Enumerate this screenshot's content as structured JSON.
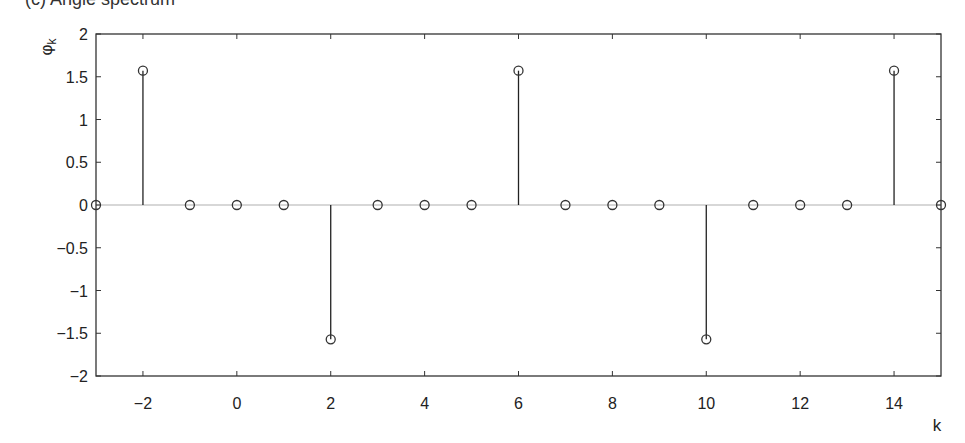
{
  "chart_data": {
    "type": "stem",
    "title": "(c) Angle spectrum",
    "title_note": "title is cropped at top edge; only glyph bottoms are visible",
    "xlabel": "k",
    "ylabel": "φ_k",
    "xlim": [
      -3,
      15
    ],
    "ylim": [
      -2,
      2
    ],
    "xticks": [
      -2,
      0,
      2,
      4,
      6,
      8,
      10,
      12,
      14
    ],
    "xtick_labels": [
      "−2",
      "0",
      "2",
      "4",
      "6",
      "8",
      "10",
      "12",
      "14"
    ],
    "yticks": [
      2,
      1.5,
      1,
      0.5,
      0,
      -0.5,
      -1,
      -1.5,
      -2
    ],
    "ytick_labels": [
      "2",
      "1.5",
      "1",
      "0.5",
      "0",
      "−0.5",
      "−1",
      "−1.5",
      "−2"
    ],
    "grid": false,
    "legend": null,
    "baseline": 0,
    "marker": "open-circle",
    "x": [
      -3,
      -2,
      -1,
      0,
      1,
      2,
      3,
      4,
      5,
      6,
      7,
      8,
      9,
      10,
      11,
      12,
      13,
      14,
      15
    ],
    "values": [
      0,
      1.5708,
      0,
      0,
      0,
      -1.5708,
      0,
      0,
      0,
      1.5708,
      0,
      0,
      0,
      -1.5708,
      0,
      0,
      0,
      1.5708,
      0
    ]
  },
  "colors": {
    "axes": "#333333",
    "stem": "#222222",
    "baseline": "#b0b0b0",
    "marker": "#333333"
  }
}
